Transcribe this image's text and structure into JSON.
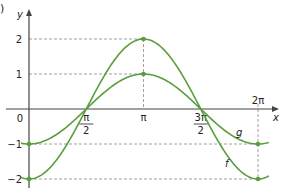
{
  "part_label": ")",
  "chart_data": {
    "type": "line",
    "title": "",
    "xlabel": "x",
    "ylabel": "y",
    "xlim": [
      0,
      6.2832
    ],
    "ylim": [
      -2,
      2
    ],
    "x_ticks": [
      {
        "value": 0,
        "label": "0"
      },
      {
        "value": 1.5708,
        "label": "π/2",
        "num": "π",
        "den": "2"
      },
      {
        "value": 3.1416,
        "label": "π"
      },
      {
        "value": 4.7124,
        "label": "3π/2",
        "num": "3π",
        "den": "2"
      },
      {
        "value": 6.2832,
        "label": "2π"
      }
    ],
    "y_ticks": [
      {
        "value": 2,
        "label": "2"
      },
      {
        "value": 1,
        "label": "1"
      },
      {
        "value": -1,
        "label": "−1"
      },
      {
        "value": -2,
        "label": "−2"
      }
    ],
    "series": [
      {
        "name": "f",
        "expression": "-2cos(x)",
        "color": "#5a9e3c",
        "key_points": [
          [
            0,
            -2
          ],
          [
            1.5708,
            0
          ],
          [
            3.1416,
            2
          ],
          [
            4.7124,
            0
          ],
          [
            6.2832,
            -2
          ]
        ]
      },
      {
        "name": "g",
        "expression": "-cos(x)",
        "color": "#5a9e3c",
        "key_points": [
          [
            0,
            -1
          ],
          [
            1.5708,
            0
          ],
          [
            3.1416,
            1
          ],
          [
            4.7124,
            0
          ],
          [
            6.2832,
            -1
          ]
        ]
      }
    ],
    "grid": false,
    "guide_lines": "dashed lines at y=2, y=1, y=-1, y=-2 and x=π, x=2π",
    "legend": "inline labels f and g near curves"
  }
}
